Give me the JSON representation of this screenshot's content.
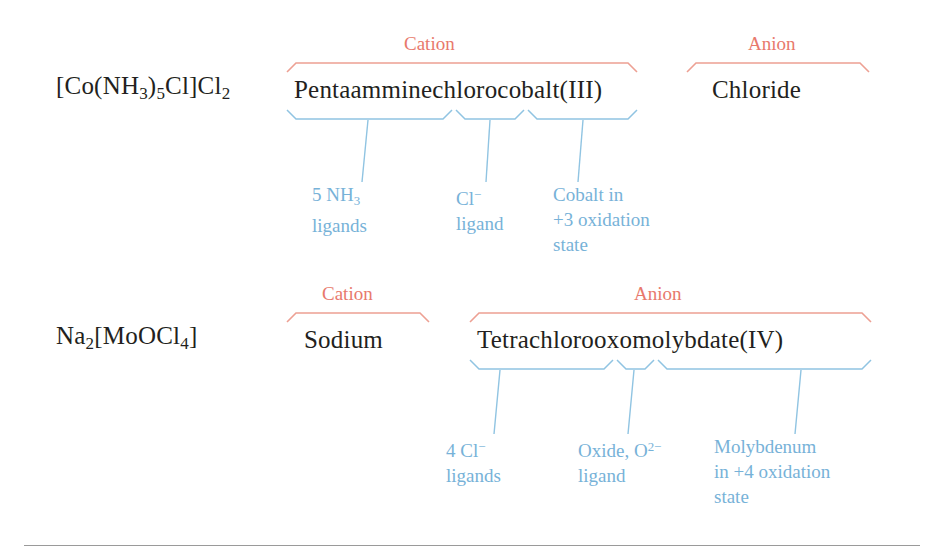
{
  "diagram": {
    "colors": {
      "text": "#231f20",
      "cation_anion_label": "#e8796c",
      "annotation": "#77b2d8",
      "rule": "#9a9a9a",
      "background": "#ffffff"
    },
    "examples": [
      {
        "id": "example-1",
        "formula_html": "[Co(NH<sub>3</sub>)<sub>5</sub>Cl]Cl<sub>2</sub>",
        "formula_text": "[Co(NH3)5Cl]Cl2",
        "parts": [
          {
            "role_label": "Cation",
            "name": "Pentaamminechlorocobalt(III)",
            "annotations": [
              {
                "label_html": "5 NH<sub>3</sub><br>ligands",
                "label_text": "5 NH3 ligands"
              },
              {
                "label_html": "Cl<sup>&#8722;</sup><br>ligand",
                "label_text": "Cl- ligand"
              },
              {
                "label_html": "Cobalt in<br>+3 oxidation<br>state",
                "label_text": "Cobalt in +3 oxidation state"
              }
            ]
          },
          {
            "role_label": "Anion",
            "name": "Chloride",
            "annotations": []
          }
        ]
      },
      {
        "id": "example-2",
        "formula_html": "Na<sub>2</sub>[MoOCl<sub>4</sub>]",
        "formula_text": "Na2[MoOCl4]",
        "parts": [
          {
            "role_label": "Cation",
            "name": "Sodium",
            "annotations": []
          },
          {
            "role_label": "Anion",
            "name": "Tetrachlorooxomolybdate(IV)",
            "annotations": [
              {
                "label_html": "4 Cl<sup>&#8722;</sup><br>ligands",
                "label_text": "4 Cl- ligands"
              },
              {
                "label_html": "Oxide, O<sup>2&#8722;</sup><br>ligand",
                "label_text": "Oxide, O2- ligand"
              },
              {
                "label_html": "Molybdenum<br>in +4 oxidation<br>state",
                "label_text": "Molybdenum in +4 oxidation state"
              }
            ]
          }
        ]
      }
    ]
  }
}
